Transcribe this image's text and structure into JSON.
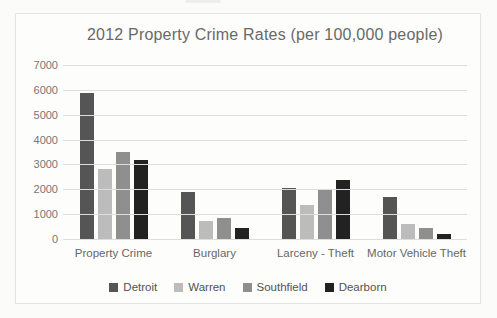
{
  "chart_data": {
    "type": "bar",
    "title": "2012 Property Crime Rates (per 100,000 people)",
    "categories": [
      "Property Crime",
      "Burglary",
      "Larceny - Theft",
      "Motor Vehicle Theft"
    ],
    "series": [
      {
        "name": "Detroit",
        "color": "#555555",
        "values": [
          5900,
          1950,
          2100,
          1750
        ]
      },
      {
        "name": "Warren",
        "color": "#bcbcbc",
        "values": [
          2850,
          750,
          1400,
          650
        ]
      },
      {
        "name": "Southfield",
        "color": "#8f8f8f",
        "values": [
          3550,
          900,
          2050,
          500
        ]
      },
      {
        "name": "Dearborn",
        "color": "#222222",
        "values": [
          3200,
          500,
          2400,
          250
        ]
      }
    ],
    "xlabel": "",
    "ylabel": "",
    "ylim": [
      0,
      7000
    ],
    "yticks": [
      0,
      1000,
      2000,
      3000,
      4000,
      5000,
      6000,
      7000
    ],
    "grid": "horizontal",
    "legend_position": "bottom",
    "colors": {
      "title_text": "#696969",
      "axis_text": "#767676",
      "gridline": "#dddddb",
      "chart_border": "#e5e4e2",
      "background": "#fdfdfc"
    }
  }
}
